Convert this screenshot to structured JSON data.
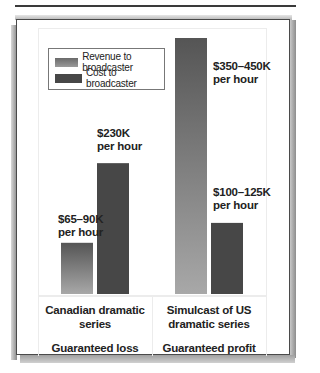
{
  "chart_data": {
    "type": "bar",
    "title": "",
    "xlabel": "",
    "ylabel": "",
    "categories": [
      "Canadian dramatic series",
      "Simulcast of US dramatic series"
    ],
    "category_lines": [
      [
        "Canadian dramatic",
        "series"
      ],
      [
        "Simulcast of US",
        "dramatic series"
      ]
    ],
    "outcomes": [
      "Guaranteed loss",
      "Guaranteed profit"
    ],
    "series": [
      {
        "name": "Revenue to broadcaster",
        "color_top": "#555555",
        "color_bottom": "#a8a8a8",
        "values_k_per_hour": [
          [
            65,
            90
          ],
          [
            350,
            450
          ]
        ],
        "labels": [
          [
            "$65–90K",
            "per hour"
          ],
          [
            "$350–450K",
            "per hour"
          ]
        ]
      },
      {
        "name": "Cost to broadcaster",
        "color_top": "#474747",
        "color_bottom": "#474747",
        "values_k_per_hour": [
          [
            230,
            230
          ],
          [
            100,
            125
          ]
        ],
        "labels": [
          [
            "$230K",
            "per hour"
          ],
          [
            "$100–125K",
            "per hour"
          ]
        ]
      }
    ],
    "ylim": [
      0,
      450
    ],
    "grid": false,
    "legend_position": "top-left",
    "units": "thousand dollars per hour"
  }
}
